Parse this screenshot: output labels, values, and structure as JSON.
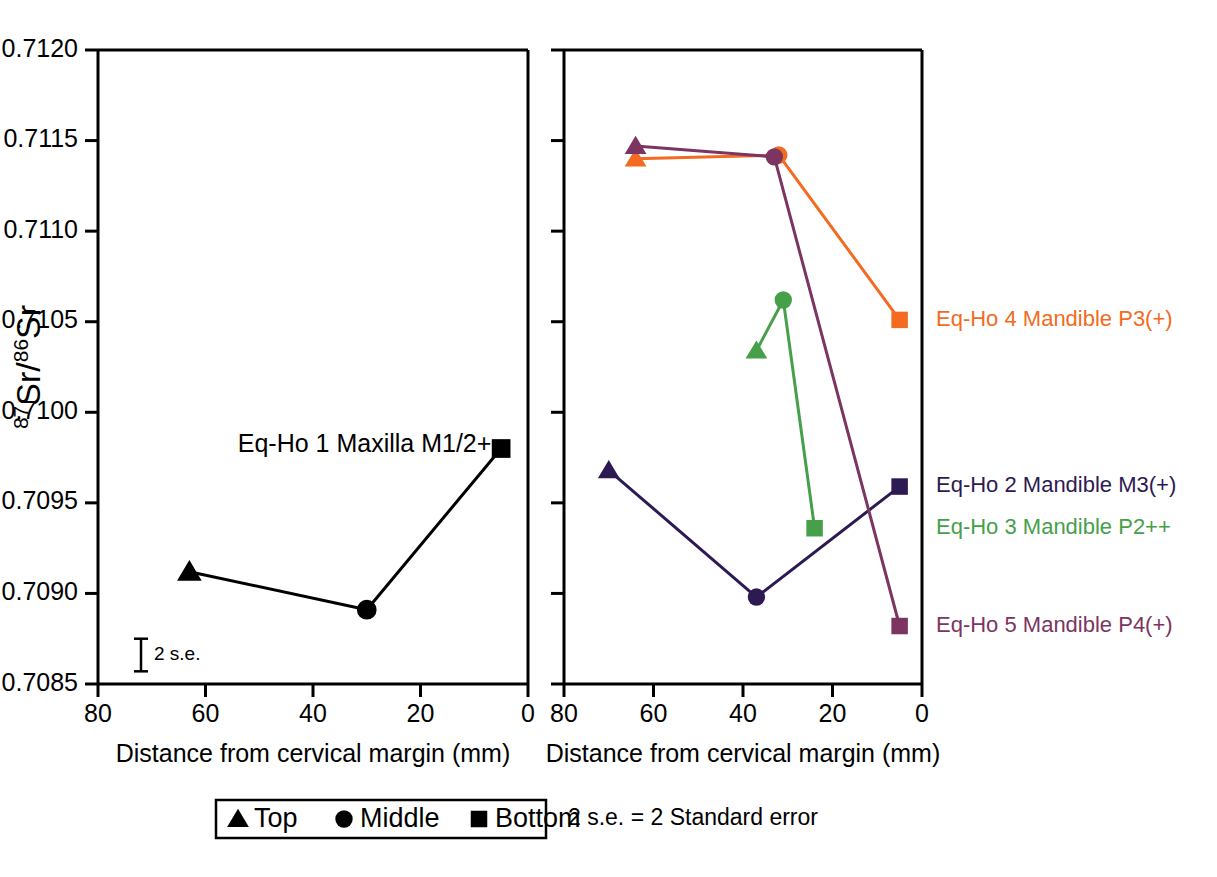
{
  "chart_data": {
    "type": "line",
    "title": "",
    "xlabel": "Distance from cervical margin (mm)",
    "ylabel": "87Sr/86Sr",
    "ylabel_parts": {
      "sup1": "87",
      "base1": "Sr/",
      "sup2": "86",
      "base2": "Sr"
    },
    "xlim": [
      80,
      0
    ],
    "ylim": [
      0.7085,
      0.712
    ],
    "x_reversed": true,
    "grid": false,
    "xticks": [
      80,
      60,
      40,
      20,
      0
    ],
    "xtick_labels": [
      "80",
      "60",
      "40",
      "20",
      "0"
    ],
    "yticks": [
      0.7085,
      0.709,
      0.7095,
      0.71,
      0.7105,
      0.711,
      0.7115,
      0.712
    ],
    "ytick_labels": [
      "0.7085",
      "0.7090",
      "0.7095",
      "0.7100",
      "0.7105",
      "0.7110",
      "0.7115",
      "0.7120"
    ],
    "panels": [
      {
        "name": "left-panel",
        "annotation": "Eq-Ho 1 Maxilla M1/2+",
        "annotation_x": 54,
        "annotation_y": 0.70982,
        "error_bar": {
          "label": "2 s.e.",
          "x": 72,
          "y": 0.70866,
          "half_height": 9e-05
        },
        "series": [
          {
            "name": "Eq-Ho 1 Maxilla M1/2+",
            "color": "#000000",
            "points": [
              {
                "position": "Top",
                "marker": "triangle",
                "x": 63,
                "y": 0.70912
              },
              {
                "position": "Middle",
                "marker": "circle",
                "x": 30,
                "y": 0.70891
              },
              {
                "position": "Bottom",
                "marker": "square",
                "x": 5,
                "y": 0.7098
              }
            ]
          }
        ]
      },
      {
        "name": "right-panel",
        "annotation": "",
        "series": [
          {
            "name": "Eq-Ho 4 Mandible P3(+)",
            "color": "#F26B21",
            "label_x": 0,
            "label_y": 0.71051,
            "points": [
              {
                "position": "Top",
                "marker": "triangle",
                "x": 64,
                "y": 0.7114
              },
              {
                "position": "Middle",
                "marker": "circle",
                "x": 32,
                "y": 0.71142
              },
              {
                "position": "Bottom",
                "marker": "square",
                "x": 5,
                "y": 0.71051
              }
            ]
          },
          {
            "name": "Eq-Ho 2 Mandible M3(+)",
            "color": "#2E1A52",
            "label_x": 0,
            "label_y": 0.70959,
            "points": [
              {
                "position": "Top",
                "marker": "triangle",
                "x": 70,
                "y": 0.70968
              },
              {
                "position": "Middle",
                "marker": "circle",
                "x": 37,
                "y": 0.70898
              },
              {
                "position": "Bottom",
                "marker": "square",
                "x": 5,
                "y": 0.70959
              }
            ]
          },
          {
            "name": "Eq-Ho 3 Mandible P2++",
            "color": "#46A04A",
            "label_x": 0,
            "label_y": 0.70936,
            "points": [
              {
                "position": "Top",
                "marker": "triangle",
                "x": 37,
                "y": 0.71034
              },
              {
                "position": "Middle",
                "marker": "circle",
                "x": 31,
                "y": 0.71062
              },
              {
                "position": "Bottom",
                "marker": "square",
                "x": 24,
                "y": 0.70936
              }
            ]
          },
          {
            "name": "Eq-Ho 5 Mandible P4(+)",
            "color": "#7B3560",
            "label_x": 0,
            "label_y": 0.70882,
            "points": [
              {
                "position": "Top",
                "marker": "triangle",
                "x": 64,
                "y": 0.71147
              },
              {
                "position": "Middle",
                "marker": "circle",
                "x": 33,
                "y": 0.71141
              },
              {
                "position": "Bottom",
                "marker": "square",
                "x": 5,
                "y": 0.70882
              }
            ]
          }
        ]
      }
    ],
    "legend": {
      "position": "bottom",
      "entries": [
        {
          "marker": "triangle",
          "label": "Top"
        },
        {
          "marker": "circle",
          "label": "Middle"
        },
        {
          "marker": "square",
          "label": "Bottom"
        }
      ]
    },
    "footnote": "2 s.e. = 2 Standard error"
  },
  "colors": {
    "axis": "#000000",
    "series_1": "#000000",
    "series_2": "#2E1A52",
    "series_3": "#46A04A",
    "series_4": "#F26B21",
    "series_5": "#7B3560"
  }
}
